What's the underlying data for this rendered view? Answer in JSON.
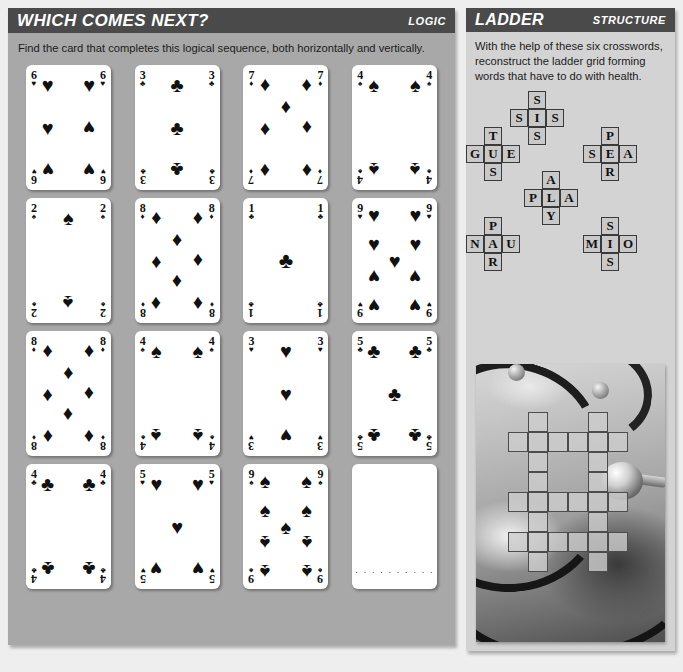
{
  "logic": {
    "title": "WHICH COMES NEXT?",
    "tag": "LOGIC",
    "instructions": "Find the card that completes this logical sequence, both horizontally and vertically.",
    "cards": [
      {
        "rank": "6",
        "suit": "hearts",
        "glyph": "♥",
        "count": 6,
        "blank": false
      },
      {
        "rank": "3",
        "suit": "clubs",
        "glyph": "♣",
        "count": 3,
        "blank": false
      },
      {
        "rank": "7",
        "suit": "diamonds",
        "glyph": "♦",
        "count": 7,
        "blank": false
      },
      {
        "rank": "4",
        "suit": "spades",
        "glyph": "♠",
        "count": 4,
        "blank": false
      },
      {
        "rank": "2",
        "suit": "spades",
        "glyph": "♠",
        "count": 2,
        "blank": false
      },
      {
        "rank": "8",
        "suit": "diamonds",
        "glyph": "♦",
        "count": 8,
        "blank": false
      },
      {
        "rank": "1",
        "suit": "clubs",
        "glyph": "♣",
        "count": 1,
        "blank": false
      },
      {
        "rank": "9",
        "suit": "hearts",
        "glyph": "♥",
        "count": 9,
        "blank": false
      },
      {
        "rank": "8",
        "suit": "diamonds",
        "glyph": "♦",
        "count": 8,
        "blank": false
      },
      {
        "rank": "4",
        "suit": "spades",
        "glyph": "♠",
        "count": 4,
        "blank": false
      },
      {
        "rank": "3",
        "suit": "hearts",
        "glyph": "♥",
        "count": 3,
        "blank": false
      },
      {
        "rank": "5",
        "suit": "clubs",
        "glyph": "♣",
        "count": 5,
        "blank": false
      },
      {
        "rank": "4",
        "suit": "clubs",
        "glyph": "♣",
        "count": 4,
        "blank": false
      },
      {
        "rank": "5",
        "suit": "hearts",
        "glyph": "♥",
        "count": 5,
        "blank": false
      },
      {
        "rank": "9",
        "suit": "spades",
        "glyph": "♠",
        "count": 9,
        "blank": false
      },
      {
        "rank": "",
        "suit": "",
        "glyph": "",
        "count": 0,
        "blank": true,
        "answer_dots": "· · · · · · · · · ·"
      }
    ]
  },
  "structure": {
    "title": "LADDER",
    "tag": "STRUCTURE",
    "instructions": "With the help of these six crosswords, reconstruct the ladder grid forming words that have to do with health.",
    "crosswords": [
      {
        "name": "crossword-sis",
        "left": 44,
        "top": 0,
        "cells": [
          {
            "c": 1,
            "r": 0,
            "letter": "S"
          },
          {
            "c": 0,
            "r": 1,
            "letter": "S"
          },
          {
            "c": 1,
            "r": 1,
            "letter": "I"
          },
          {
            "c": 2,
            "r": 1,
            "letter": "S"
          },
          {
            "c": 1,
            "r": 2,
            "letter": "S"
          }
        ]
      },
      {
        "name": "crossword-gue",
        "left": 0,
        "top": 36,
        "cells": [
          {
            "c": 1,
            "r": 0,
            "letter": "T"
          },
          {
            "c": 0,
            "r": 1,
            "letter": "G"
          },
          {
            "c": 1,
            "r": 1,
            "letter": "U"
          },
          {
            "c": 2,
            "r": 1,
            "letter": "E"
          },
          {
            "c": 1,
            "r": 2,
            "letter": "S"
          }
        ]
      },
      {
        "name": "crossword-sea",
        "left": 117,
        "top": 36,
        "cells": [
          {
            "c": 1,
            "r": 0,
            "letter": "P"
          },
          {
            "c": 0,
            "r": 1,
            "letter": "S"
          },
          {
            "c": 1,
            "r": 1,
            "letter": "E"
          },
          {
            "c": 2,
            "r": 1,
            "letter": "A"
          },
          {
            "c": 1,
            "r": 2,
            "letter": "R"
          }
        ]
      },
      {
        "name": "crossword-pla",
        "left": 58,
        "top": 80,
        "cells": [
          {
            "c": 1,
            "r": 0,
            "letter": "A"
          },
          {
            "c": 0,
            "r": 1,
            "letter": "P"
          },
          {
            "c": 1,
            "r": 1,
            "letter": "L"
          },
          {
            "c": 2,
            "r": 1,
            "letter": "A"
          },
          {
            "c": 1,
            "r": 2,
            "letter": "Y"
          }
        ]
      },
      {
        "name": "crossword-nau",
        "left": 0,
        "top": 126,
        "cells": [
          {
            "c": 1,
            "r": 0,
            "letter": "P"
          },
          {
            "c": 0,
            "r": 1,
            "letter": "N"
          },
          {
            "c": 1,
            "r": 1,
            "letter": "A"
          },
          {
            "c": 2,
            "r": 1,
            "letter": "U"
          },
          {
            "c": 1,
            "r": 2,
            "letter": "R"
          }
        ]
      },
      {
        "name": "crossword-mio",
        "left": 117,
        "top": 126,
        "cells": [
          {
            "c": 1,
            "r": 0,
            "letter": "S"
          },
          {
            "c": 0,
            "r": 1,
            "letter": "M"
          },
          {
            "c": 1,
            "r": 1,
            "letter": "I"
          },
          {
            "c": 2,
            "r": 1,
            "letter": "O"
          },
          {
            "c": 1,
            "r": 2,
            "letter": "S"
          }
        ]
      }
    ],
    "ladder_grid": {
      "rows": 8,
      "cols": 6,
      "cell_size": 20,
      "filled": [
        [
          0,
          1,
          0,
          0,
          1,
          0
        ],
        [
          1,
          1,
          1,
          1,
          1,
          1
        ],
        [
          0,
          1,
          0,
          0,
          1,
          0
        ],
        [
          0,
          1,
          0,
          0,
          1,
          0
        ],
        [
          1,
          1,
          1,
          1,
          1,
          1
        ],
        [
          0,
          1,
          0,
          0,
          1,
          0
        ],
        [
          1,
          1,
          1,
          1,
          1,
          1
        ],
        [
          0,
          1,
          0,
          0,
          1,
          0
        ]
      ]
    },
    "photo": {
      "name": "stethoscope-photo",
      "description": "stethoscope"
    }
  },
  "colors": {
    "title_bar": "#4a4a4a",
    "logic_panel_bg": "#a8a8a8",
    "structure_panel_bg": "#d3d3d3",
    "page_bg": "#eeeeee",
    "card_bg": "#ffffff",
    "crossword_cell": "#c9c9c9",
    "ink": "#111111"
  }
}
